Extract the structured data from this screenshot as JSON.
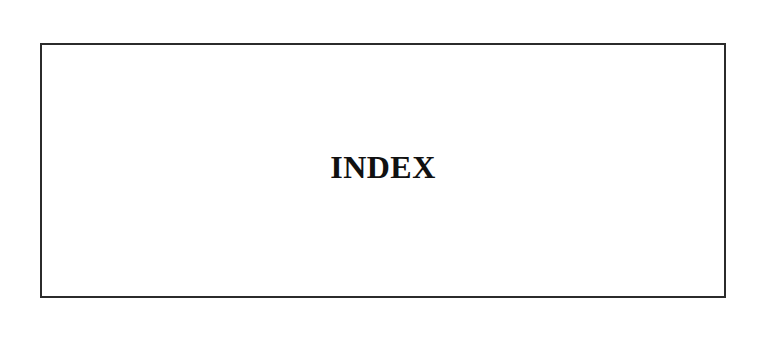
{
  "page": {
    "background_color": "#ffffff",
    "width": 761,
    "height": 361
  },
  "frame": {
    "border_color": "#2b2b2b",
    "border_width_px": 2,
    "fill_color": "#ffffff",
    "left_px": 40,
    "top_px": 43,
    "width_px": 686,
    "height_px": 255
  },
  "content": {
    "heading": "INDEX",
    "heading_color": "#111111",
    "heading_font_size_px": 32,
    "heading_weight": "bold",
    "heading_align": "center"
  }
}
